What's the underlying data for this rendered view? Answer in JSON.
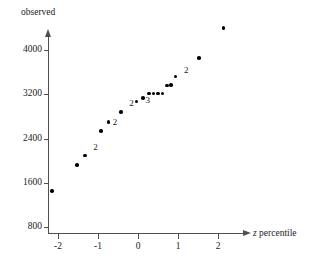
{
  "chart_data": {
    "type": "scatter",
    "title": "",
    "xlabel": "z percentile",
    "ylabel": "observed",
    "xlim": [
      -2.55,
      2.45
    ],
    "ylim": [
      650,
      4450
    ],
    "grid": false,
    "legend": null,
    "xticks": [
      -2,
      -1,
      0,
      1,
      2
    ],
    "xtick_labels": [
      "-2",
      "-1",
      "0",
      "1",
      "2"
    ],
    "yticks": [
      4000,
      3200,
      2400,
      1600,
      800
    ],
    "ytick_labels": [
      "4000",
      "3200",
      "2400",
      "1600",
      "800"
    ],
    "points": [
      {
        "x": -2.15,
        "y": 1450,
        "count": 1,
        "label": ""
      },
      {
        "x": -1.52,
        "y": 1920,
        "count": 1,
        "label": ""
      },
      {
        "x": -1.32,
        "y": 2090,
        "count": 1,
        "label": ""
      },
      {
        "x": -0.92,
        "y": 2540,
        "count": 2,
        "label": "2"
      },
      {
        "x": -0.74,
        "y": 2700,
        "count": 1,
        "label": ""
      },
      {
        "x": -0.42,
        "y": 2880,
        "count": 2,
        "label": "2"
      },
      {
        "x": -0.04,
        "y": 3070,
        "count": 1,
        "label": ""
      },
      {
        "x": 0.12,
        "y": 3130,
        "count": 3,
        "label": "3"
      },
      {
        "x": 0.28,
        "y": 3210,
        "count": 1,
        "label": ""
      },
      {
        "x": 0.39,
        "y": 3210,
        "count": 1,
        "label": ""
      },
      {
        "x": 0.5,
        "y": 3210,
        "count": 1,
        "label": ""
      },
      {
        "x": 0.61,
        "y": 3210,
        "count": 1,
        "label": ""
      },
      {
        "x": 0.72,
        "y": 3360,
        "count": 1,
        "label": ""
      },
      {
        "x": 0.82,
        "y": 3370,
        "count": 1,
        "label": ""
      },
      {
        "x": 0.94,
        "y": 3520,
        "count": 2,
        "label": "2"
      },
      {
        "x": 1.52,
        "y": 3860,
        "count": 1,
        "label": ""
      },
      {
        "x": 2.14,
        "y": 4400,
        "count": 1,
        "label": ""
      }
    ],
    "multiplicity_labels": [
      {
        "text": "2",
        "x": -1.12,
        "y": 2230
      },
      {
        "text": "2",
        "x": -0.63,
        "y": 2680
      },
      {
        "text": "2",
        "x": -0.22,
        "y": 3020
      },
      {
        "text": "3",
        "x": 0.19,
        "y": 3080
      },
      {
        "text": "2",
        "x": 1.15,
        "y": 3620
      }
    ]
  }
}
